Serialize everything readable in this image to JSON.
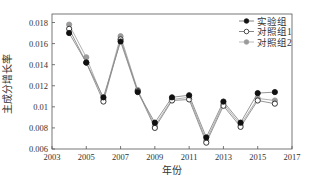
{
  "chart_data": {
    "type": "line",
    "title": "",
    "xlabel": "年份",
    "ylabel": "主成分增长率",
    "xlim": [
      2003,
      2017
    ],
    "ylim": [
      0.006,
      0.018
    ],
    "xticks": [
      2003,
      2005,
      2007,
      2009,
      2011,
      2013,
      2015,
      2017
    ],
    "xtick_labels": [
      "2003",
      "2005",
      "2007",
      "2009",
      "2011",
      "2013",
      "2015",
      "2017"
    ],
    "yticks": [
      0.006,
      0.008,
      0.01,
      0.012,
      0.014,
      0.016,
      0.018
    ],
    "ytick_labels": [
      "0.006",
      "0.008",
      "0.01",
      "0.012",
      "0.014",
      "0.016",
      "0.018"
    ],
    "grid": false,
    "legend_position": "upper right",
    "x": [
      2004,
      2005,
      2006,
      2007,
      2008,
      2009,
      2010,
      2011,
      2012,
      2013,
      2014,
      2015,
      2016
    ],
    "series": [
      {
        "name": "实验组",
        "marker": "filled-circle",
        "color": "#111111",
        "values": [
          0.017,
          0.0142,
          0.0109,
          0.0162,
          0.0114,
          0.0085,
          0.0109,
          0.0111,
          0.0071,
          0.0105,
          0.0085,
          0.0113,
          0.0114
        ]
      },
      {
        "name": "对照组1",
        "marker": "open-circle",
        "color": "#333333",
        "values": [
          0.0174,
          0.0142,
          0.0105,
          0.0164,
          0.0115,
          0.008,
          0.0106,
          0.0107,
          0.0066,
          0.0101,
          0.0081,
          0.0106,
          0.0103
        ]
      },
      {
        "name": "对照组2",
        "marker": "gray-circle",
        "color": "#9a9a9a",
        "values": [
          0.0178,
          0.0147,
          0.0107,
          0.0167,
          0.0116,
          0.0082,
          0.0107,
          0.0109,
          0.0068,
          0.0103,
          0.0083,
          0.0108,
          0.0106
        ]
      }
    ]
  }
}
